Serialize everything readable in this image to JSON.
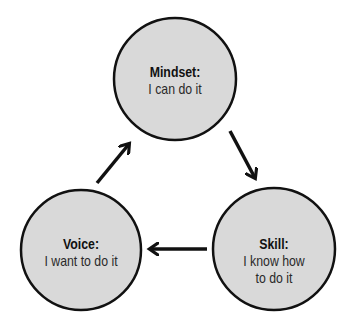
{
  "diagram": {
    "type": "cycle",
    "colors": {
      "node_fill": "#d9d9d9",
      "node_stroke": "#111111",
      "arrow": "#111111",
      "background": "#ffffff"
    },
    "nodes": [
      {
        "id": "mindset",
        "title": "Mindset:",
        "desc_lines": [
          "I can do it"
        ],
        "cx": 175,
        "cy": 79,
        "r": 61
      },
      {
        "id": "skill",
        "title": "Skill:",
        "desc_lines": [
          "I know how",
          "to do it"
        ],
        "cx": 274,
        "cy": 249,
        "r": 61
      },
      {
        "id": "voice",
        "title": "Voice:",
        "desc_lines": [
          "I want to do it"
        ],
        "cx": 81,
        "cy": 250,
        "r": 60
      }
    ],
    "edges": [
      {
        "from": "mindset",
        "to": "skill"
      },
      {
        "from": "skill",
        "to": "voice"
      },
      {
        "from": "voice",
        "to": "mindset"
      }
    ]
  }
}
